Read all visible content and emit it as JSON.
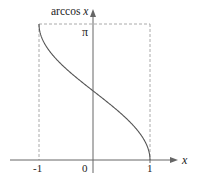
{
  "chart_data": {
    "type": "line",
    "title": "",
    "function": "arccos x",
    "xlabel": "x",
    "ylabel": "arccos x",
    "xlim": [
      -1,
      1
    ],
    "ylim": [
      0,
      3.14159
    ],
    "x_ticks": [
      "-1",
      "0",
      "1"
    ],
    "y_ticks": [
      "π"
    ],
    "grid": false,
    "legend": null,
    "series": [
      {
        "name": "arccos x",
        "x": [
          -1,
          -0.9,
          -0.75,
          -0.5,
          -0.25,
          0,
          0.25,
          0.5,
          0.75,
          0.9,
          1
        ],
        "y": [
          3.1416,
          2.6906,
          2.4189,
          2.0944,
          1.8235,
          1.5708,
          1.3181,
          1.0472,
          0.7227,
          0.451,
          0
        ]
      }
    ],
    "guides": {
      "dashed_box": {
        "x": [
          -1,
          1
        ],
        "y": [
          0,
          3.14159
        ]
      }
    }
  },
  "labels": {
    "y_axis": "arccos x",
    "y_axis_prefix": "arccos ",
    "y_axis_var": "x",
    "x_axis": "x",
    "tick_neg1": "-1",
    "tick_0": "0",
    "tick_1": "1",
    "tick_pi": "π"
  },
  "colors": {
    "axis": "#555555",
    "curve": "#555555",
    "dashed": "#aaaaaa",
    "text": "#222222"
  }
}
